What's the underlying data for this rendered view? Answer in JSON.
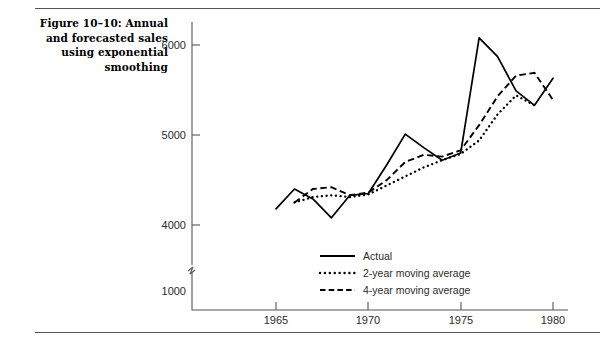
{
  "figure": {
    "title": "Figure 10–10: Annual and forecasted sales using exponential smoothing"
  },
  "axis": {
    "y_ticks": [
      "6000",
      "5000",
      "4000",
      "1000"
    ],
    "x_ticks": [
      "1965",
      "1970",
      "1975",
      "1980"
    ],
    "break_symbol": "axis-break"
  },
  "legend": {
    "items": [
      {
        "label": "Actual",
        "style": "solid"
      },
      {
        "label": "2-year moving average",
        "style": "dotted"
      },
      {
        "label": "4-year moving average",
        "style": "dashed"
      }
    ]
  },
  "chart_data": {
    "type": "line",
    "title": "Figure 10–10: Annual and forecasted sales using exponential smoothing",
    "xlabel": "",
    "ylabel": "",
    "xlim": [
      1964.5,
      1980.5
    ],
    "ylim": [
      3900,
      6200
    ],
    "yticks": [
      4000,
      5000,
      6000
    ],
    "xticks": [
      1965,
      1970,
      1975,
      1980
    ],
    "y_axis_break_below": 4000,
    "y_axis_break_label": 1000,
    "grid": false,
    "legend_position": "inside-bottom-center",
    "x": [
      1965,
      1966,
      1967,
      1968,
      1969,
      1970,
      1971,
      1972,
      1973,
      1974,
      1975,
      1976,
      1977,
      1978,
      1979,
      1980
    ],
    "series": [
      {
        "name": "Actual",
        "style": "solid",
        "x": [
          1965,
          1966,
          1967,
          1968,
          1969,
          1970,
          1971,
          1972,
          1973,
          1974,
          1975,
          1976,
          1977,
          1978,
          1979,
          1980
        ],
        "values": [
          4180,
          4400,
          4290,
          4080,
          4330,
          4350,
          4670,
          5010,
          4860,
          4720,
          4800,
          6080,
          5870,
          5490,
          5330,
          5630
        ]
      },
      {
        "name": "2-year moving average",
        "style": "dotted",
        "x": [
          1966,
          1967,
          1968,
          1969,
          1970,
          1971,
          1972,
          1973,
          1974,
          1975,
          1976,
          1977,
          1978,
          1979
        ],
        "values": [
          4250,
          4310,
          4330,
          4310,
          4340,
          4440,
          4540,
          4640,
          4720,
          4790,
          4940,
          5230,
          5440,
          5330
        ]
      },
      {
        "name": "4-year moving average",
        "style": "dashed",
        "x": [
          1966,
          1967,
          1968,
          1969,
          1970,
          1971,
          1972,
          1973,
          1974,
          1975,
          1976,
          1977,
          1978,
          1979,
          1980
        ],
        "values": [
          4250,
          4400,
          4420,
          4330,
          4360,
          4500,
          4700,
          4780,
          4760,
          4830,
          5110,
          5430,
          5660,
          5690,
          5390
        ]
      }
    ]
  }
}
